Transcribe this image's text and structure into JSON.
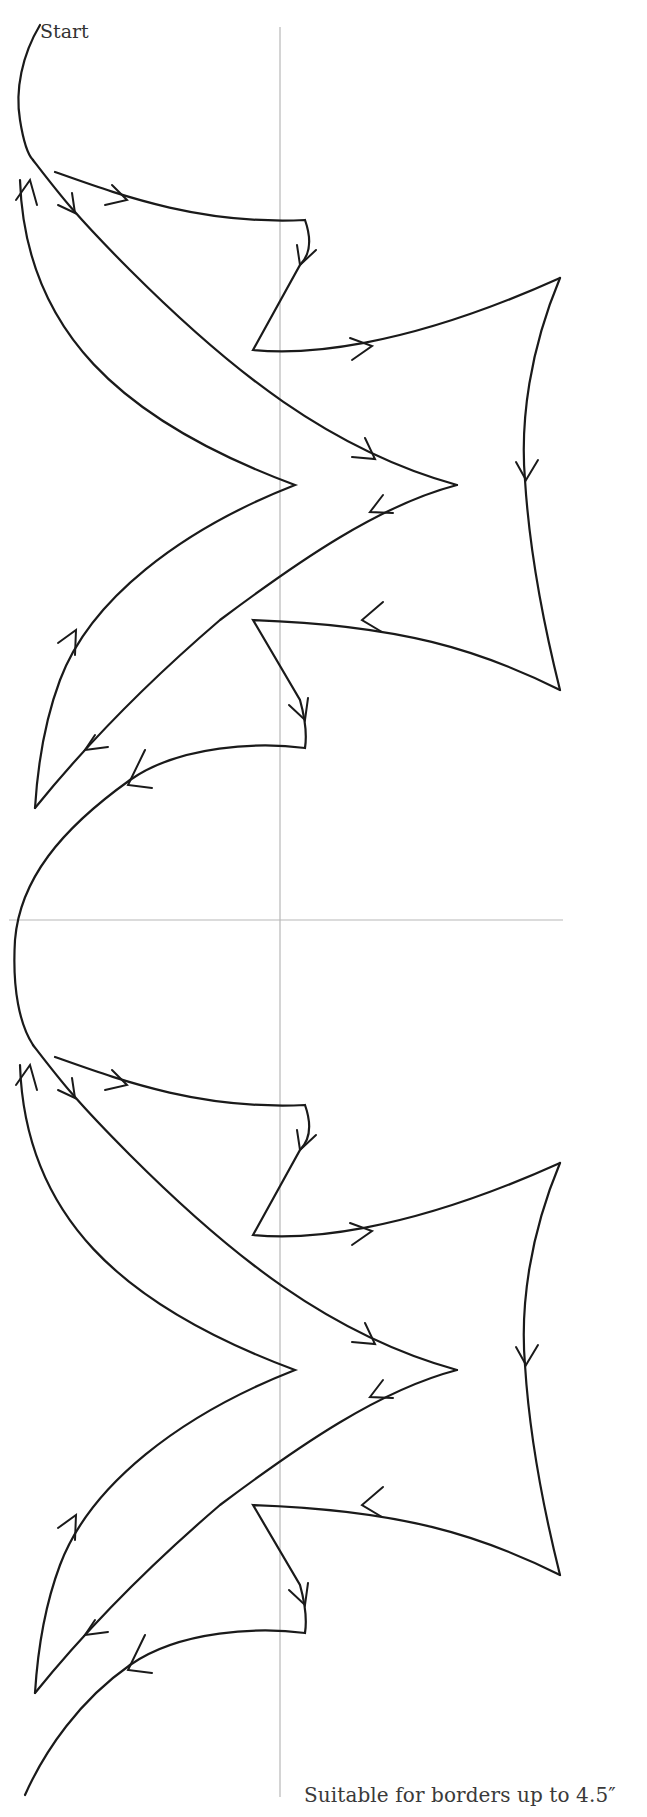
{
  "diagram": {
    "start_label": "Start",
    "caption": "Suitable for borders up to 4.5″",
    "repeats": 2,
    "repeat_height_px": 885,
    "colors": {
      "cord": "#1a1a1a",
      "guide": "#b8b8b8",
      "background": "#ffffff",
      "text": "#333333"
    },
    "guides": {
      "vertical_x": 280,
      "horizontal_y": 920
    },
    "arrow_directions": [
      "down-right",
      "right",
      "down",
      "right",
      "down",
      "down-right",
      "down-left",
      "left",
      "down",
      "down-left",
      "up",
      "up",
      "left"
    ]
  }
}
